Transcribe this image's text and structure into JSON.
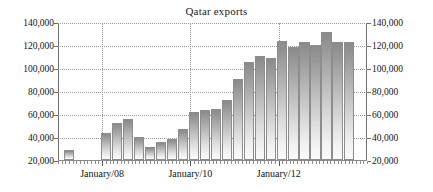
{
  "chart_data": {
    "type": "bar",
    "title": "Qatar exports",
    "xlabel": "",
    "ylabel": "",
    "ylim": [
      20000,
      140000
    ],
    "grid": true,
    "legend": false,
    "y_ticks": [
      20000,
      40000,
      60000,
      80000,
      100000,
      120000,
      140000
    ],
    "y_tick_labels": [
      "20,000",
      "40,000",
      "60,000",
      "80,000",
      "100,000",
      "120,000",
      "140,000"
    ],
    "y_axis_right_labels": [
      "20,000",
      "40,000",
      "60,000",
      "80,000",
      "100,000",
      "120,000",
      "140,000"
    ],
    "x_tick_labels": [
      "January/08",
      "January/10",
      "January/12"
    ],
    "x_tick_positions_months": [
      12,
      36,
      60
    ],
    "categories": [
      "Oct/07",
      "Apr/08",
      "Jul/08",
      "Oct/08",
      "Jan/09",
      "Apr/09",
      "Jul/09",
      "Oct/09",
      "Jan/10",
      "Apr/10",
      "Jul/10",
      "Oct/10",
      "Jan/11",
      "Apr/11",
      "Jul/11",
      "Oct/11",
      "Jan/12",
      "Apr/12",
      "Jul/12",
      "Oct/12",
      "Jan/13",
      "Apr/13",
      "Jul/13",
      "Oct/13"
    ],
    "values": [
      29000,
      43500,
      52000,
      56000,
      40000,
      31000,
      36000,
      38500,
      47000,
      62000,
      63500,
      64000,
      72000,
      90500,
      105000,
      110500,
      109000,
      123500,
      118500,
      122500,
      120000,
      131000,
      123000,
      123000
    ],
    "bar_positions_months": [
      3,
      13,
      16,
      19,
      22,
      25,
      28,
      31,
      34,
      37,
      40,
      43,
      46,
      49,
      52,
      55,
      58,
      61,
      64,
      67,
      70,
      73,
      76,
      79
    ]
  }
}
